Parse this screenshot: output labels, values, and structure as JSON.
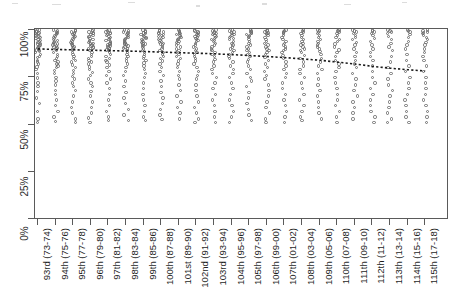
{
  "chart_data": {
    "type": "scatter",
    "title": "",
    "subtitle": "",
    "xlabel": "",
    "ylabel": "",
    "ylim": [
      0,
      100
    ],
    "y_unit": "%",
    "grid": false,
    "legend": "none",
    "y_ticks": [
      "0%",
      "25%",
      "50%",
      "75%",
      "100%"
    ],
    "y_tick_values": [
      0,
      25,
      50,
      75,
      100
    ],
    "categories": [
      "93rd (73-74)",
      "94th (75-76)",
      "95th (77-78)",
      "96th (79-80)",
      "97th (81-82)",
      "98th (83-84)",
      "99th (85-86)",
      "100th (87-88)",
      "101st (89-90)",
      "102nd (91-92)",
      "103rd (93-94)",
      "104th (95-96)",
      "105th (97-98)",
      "106th (99-00)",
      "107th (01-02)",
      "108th (03-04)",
      "109th (05-06)",
      "110th (07-08)",
      "111th (09-10)",
      "112th (11-12)",
      "113th (13-14)",
      "114th (15-16)",
      "115th (17-18)"
    ],
    "series": [
      {
        "name": "observations",
        "marker": "open-circle",
        "color": "#6e6e6e",
        "points": [
          [
            0,
            [
              100,
              99.5,
              99,
              98.5,
              98,
              97.5,
              97,
              96.5,
              96,
              95.5,
              95,
              94.5,
              94,
              93.5,
              93,
              92.5,
              92,
              91.5,
              91,
              90.5,
              90,
              89.5,
              89,
              88.5,
              88,
              87,
              86,
              85.5,
              84,
              83,
              82,
              80.5,
              79,
              77,
              74.5,
              72,
              70,
              67.5,
              64,
              61,
              57,
              53,
              51
            ]
          ],
          [
            1,
            [
              100,
              99.5,
              99,
              98.5,
              98,
              97.5,
              97,
              96.5,
              96,
              95.5,
              95,
              94.5,
              94,
              93.5,
              93,
              92.5,
              92,
              91.5,
              91,
              90.5,
              90,
              89,
              88,
              87,
              86,
              85,
              84,
              83,
              82,
              81,
              80,
              78.5,
              77,
              75,
              73,
              71,
              68,
              66,
              63,
              60,
              57,
              54,
              51.5
            ]
          ],
          [
            2,
            [
              100,
              99.5,
              99,
              98.5,
              98,
              97.5,
              97,
              96.5,
              96,
              95.5,
              95,
              94.5,
              94,
              93.5,
              93,
              92.5,
              92,
              91.5,
              91,
              90.5,
              90,
              89,
              88,
              87,
              86,
              85,
              84,
              83,
              81.5,
              80,
              78.5,
              77,
              75.5,
              74,
              72,
              70,
              68,
              65,
              62,
              59,
              56,
              53,
              51
            ]
          ],
          [
            3,
            [
              100,
              99.5,
              99,
              98.5,
              98,
              97.5,
              97,
              96.5,
              96,
              95.5,
              95,
              94.5,
              94,
              93.5,
              93,
              92.5,
              92,
              91.5,
              91,
              90.5,
              90,
              89,
              88,
              87,
              86,
              85,
              84,
              83,
              82,
              80.5,
              79,
              77.5,
              76,
              74,
              72,
              70,
              67.5,
              65,
              62,
              59,
              56,
              53.5,
              51
            ]
          ],
          [
            4,
            [
              100,
              99.5,
              99,
              98.5,
              98,
              97.5,
              97,
              96.5,
              96,
              95.5,
              95,
              94.5,
              94,
              93.5,
              93,
              92.5,
              92,
              91.5,
              91,
              90.5,
              90,
              89.5,
              89,
              88,
              87,
              86,
              85,
              84,
              83,
              81.5,
              80,
              78,
              76,
              74,
              72,
              69,
              66,
              63,
              60,
              57,
              54,
              52
            ]
          ],
          [
            5,
            [
              100,
              99.5,
              99,
              98.5,
              98,
              97.5,
              97,
              96.5,
              96,
              95.5,
              95,
              94.5,
              94,
              93.5,
              93,
              92.5,
              92,
              91.5,
              91,
              90.5,
              90,
              89,
              88,
              87,
              86,
              85,
              83.5,
              82,
              80,
              78,
              76,
              73,
              70,
              67,
              64,
              61,
              58,
              55,
              52
            ]
          ],
          [
            6,
            [
              100,
              99.5,
              99,
              98.5,
              98,
              97.5,
              97,
              96.5,
              96,
              95.5,
              95,
              94.5,
              94,
              93.5,
              93,
              92.5,
              92,
              91.5,
              91,
              90,
              89,
              88,
              87,
              86,
              85,
              84,
              82.5,
              81,
              79,
              77,
              75,
              72,
              69,
              66,
              63,
              60,
              57,
              54,
              52
            ]
          ],
          [
            7,
            [
              100,
              99.5,
              99,
              98.5,
              98,
              97.5,
              97,
              96.5,
              96,
              95.5,
              95,
              94.5,
              94,
              93.5,
              93,
              92.5,
              92,
              91,
              90,
              89,
              88,
              87,
              86,
              85,
              83.5,
              82,
              80,
              78,
              76,
              73,
              70,
              67,
              64,
              61,
              58,
              55,
              52.5
            ]
          ],
          [
            8,
            [
              100,
              99.5,
              99,
              98.5,
              98,
              97.5,
              97,
              96.5,
              96,
              95.5,
              95,
              94.5,
              94,
              93.5,
              93,
              92,
              91,
              90,
              89,
              88,
              87,
              86,
              85,
              83.5,
              82,
              80,
              78,
              76,
              74,
              71,
              68,
              65,
              62,
              59,
              56,
              53
            ]
          ],
          [
            9,
            [
              100,
              99.5,
              99,
              98.5,
              98,
              97.5,
              97,
              96.5,
              96,
              95.5,
              95,
              94.5,
              94,
              93,
              92,
              91,
              90,
              89,
              88,
              87,
              86,
              85,
              83.5,
              82,
              80,
              78,
              76,
              74,
              71,
              68,
              65,
              62,
              59,
              56,
              53,
              51
            ]
          ],
          [
            10,
            [
              100,
              99.5,
              99,
              98.5,
              98,
              97.5,
              97,
              96.5,
              96,
              95.5,
              95,
              94.5,
              94,
              93,
              92,
              91,
              90,
              89,
              88,
              87,
              86,
              84.5,
              83,
              81,
              79,
              77,
              75,
              72,
              69,
              66,
              63,
              60,
              57,
              54,
              51
            ]
          ],
          [
            11,
            [
              100,
              99.5,
              99,
              98.5,
              98,
              97.5,
              97,
              96.5,
              96,
              95.5,
              95,
              94,
              93,
              92,
              91,
              90,
              89,
              88,
              87,
              86,
              85,
              83,
              81,
              79,
              77,
              75,
              72,
              69,
              66,
              63,
              60,
              57,
              54,
              51
            ]
          ],
          [
            12,
            [
              100,
              99.5,
              99,
              98.5,
              98,
              97.5,
              97,
              96.5,
              96,
              95,
              94,
              93,
              92,
              91,
              90,
              89,
              88,
              87,
              86,
              84.5,
              83,
              81,
              79,
              77,
              75,
              73,
              70,
              67,
              64,
              61,
              58,
              55,
              52
            ]
          ],
          [
            13,
            [
              100,
              99.5,
              99,
              98.5,
              98,
              97.5,
              97,
              96,
              95,
              94,
              93,
              92,
              91,
              90,
              89,
              88,
              87,
              85.5,
              84,
              82,
              80,
              78,
              76,
              74,
              71,
              68,
              65,
              62,
              59,
              56,
              53,
              51
            ]
          ],
          [
            14,
            [
              100,
              99.5,
              99,
              98.5,
              98,
              97,
              96,
              95,
              94,
              93,
              92,
              91,
              90,
              89,
              88,
              86.5,
              85,
              83,
              81,
              79,
              77,
              75,
              72,
              69,
              66,
              63,
              60,
              57,
              54,
              51
            ]
          ],
          [
            15,
            [
              100,
              99.5,
              99,
              98,
              97,
              96,
              95,
              94,
              93,
              92,
              91,
              90,
              89,
              88,
              86.5,
              85,
              83,
              81,
              79,
              77,
              75,
              72,
              69,
              66,
              63,
              60,
              57,
              54,
              52
            ]
          ],
          [
            16,
            [
              100,
              99.5,
              99,
              98,
              97,
              96,
              95,
              94,
              93,
              92,
              91,
              90,
              88.5,
              87,
              85,
              83,
              81,
              79,
              77,
              74,
              71,
              68,
              65,
              62,
              59,
              56,
              53
            ]
          ],
          [
            17,
            [
              100,
              99.5,
              99,
              98,
              97,
              96,
              95,
              94,
              92.5,
              91,
              89.5,
              88,
              86,
              84,
              82,
              80,
              78,
              75,
              72,
              69,
              66,
              63,
              60,
              57,
              54,
              51
            ]
          ],
          [
            18,
            [
              100,
              99.5,
              99,
              98,
              97,
              96,
              95,
              93.5,
              92,
              90,
              88,
              86,
              84,
              82,
              80,
              77,
              74,
              71,
              68,
              65,
              62,
              59,
              56,
              53
            ]
          ],
          [
            19,
            [
              100,
              99.5,
              99,
              98,
              97,
              95.5,
              94,
              92,
              90,
              88,
              86,
              84,
              81,
              78,
              75,
              72,
              69,
              66,
              63,
              60,
              57,
              54,
              51
            ]
          ],
          [
            20,
            [
              100,
              99.5,
              99,
              98,
              96.5,
              95,
              93,
              91,
              89,
              86,
              83,
              80,
              77,
              74,
              71,
              68,
              65,
              62,
              59,
              56,
              53,
              51
            ]
          ],
          [
            21,
            [
              100,
              99.5,
              99,
              97.5,
              96,
              94,
              92,
              90,
              87,
              84,
              81,
              78,
              75,
              72,
              69,
              66,
              63,
              60,
              57,
              54,
              51
            ]
          ],
          [
            22,
            [
              100,
              99.5,
              99,
              98.5,
              98,
              97,
              96,
              95,
              93.5,
              92,
              90,
              88,
              86,
              84,
              81,
              78,
              75,
              72,
              69,
              66,
              63,
              60,
              57,
              54,
              51
            ]
          ]
        ]
      }
    ],
    "trend_line": {
      "name": "fitted trend",
      "style": "dotted",
      "color": "#1a1a1a",
      "values": [
        90.0,
        89.7,
        89.5,
        89.3,
        89.1,
        88.9,
        88.6,
        88.3,
        88.0,
        87.7,
        87.4,
        87.0,
        86.5,
        86.0,
        85.4,
        84.7,
        84.0,
        83.0,
        82.0,
        80.8,
        79.8,
        79.0,
        78.3
      ]
    }
  }
}
